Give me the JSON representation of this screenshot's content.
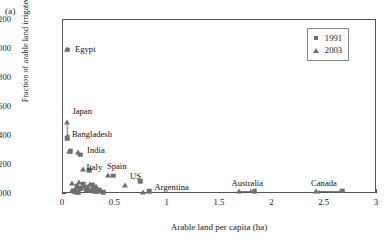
{
  "panel": {
    "label": "(a)"
  },
  "axes": {
    "xlabel": "Arable land per capita (ha)",
    "ylabel": "Fraction of arable land irrigated",
    "xticks": [
      "0",
      "0.5",
      "1",
      "1.5",
      "2",
      "2.5",
      "3"
    ],
    "yticks": [
      "0,000",
      "0,200",
      "0,400",
      "0,600",
      "0,800",
      "1,000",
      "1,200"
    ]
  },
  "legend": {
    "entries": [
      {
        "label": "1991",
        "marker": "square-marker",
        "color": "#6e6e6e"
      },
      {
        "label": "2003",
        "marker": "triangle-marker",
        "color": "#6e6e6e"
      }
    ]
  },
  "annotations": [
    {
      "text": "Egypt",
      "x": 0.115,
      "y": 0.995
    },
    {
      "text": "Japan",
      "x": 0.09,
      "y": 0.565
    },
    {
      "text": "Bangladesh",
      "x": 0.085,
      "y": 0.405
    },
    {
      "text": "India",
      "x": 0.23,
      "y": 0.3
    },
    {
      "text": "Italy",
      "x": 0.225,
      "y": 0.178
    },
    {
      "text": "Spain",
      "x": 0.42,
      "y": 0.185
    },
    {
      "text": "US",
      "x": 0.64,
      "y": 0.118
    },
    {
      "text": "Argentina",
      "x": 0.875,
      "y": 0.04
    },
    {
      "text": "Australia",
      "x": 1.61,
      "y": 0.072
    },
    {
      "text": "Canada",
      "x": 2.37,
      "y": 0.072
    }
  ],
  "chart_data": {
    "type": "scatter",
    "title": "",
    "xlabel": "Arable land per capita (ha)",
    "ylabel": "Fraction of arable land irrigated",
    "xlim": [
      0,
      3
    ],
    "ylim": [
      0,
      1.2
    ],
    "xticks": [
      0,
      0.5,
      1,
      1.5,
      2,
      2.5,
      3
    ],
    "yticks": [
      0,
      0.2,
      0.4,
      0.6,
      0.8,
      1.0,
      1.2
    ],
    "grid": false,
    "legend_position": "top-right",
    "series": [
      {
        "name": "1991",
        "marker": "square",
        "color": "#6e6e6e",
        "points": [
          {
            "x": 0.045,
            "y": 0.995,
            "label": "Egypt"
          },
          {
            "x": 0.04,
            "y": 0.385,
            "label": "Japan"
          },
          {
            "x": 0.075,
            "y": 0.295,
            "label": "Bangladesh"
          },
          {
            "x": 0.165,
            "y": 0.27,
            "label": "India"
          },
          {
            "x": 0.25,
            "y": 0.165,
            "label": "Italy"
          },
          {
            "x": 0.48,
            "y": 0.125,
            "label": "Spain"
          },
          {
            "x": 0.735,
            "y": 0.09,
            "label": "US"
          },
          {
            "x": 0.825,
            "y": 0.018,
            "label": "Argentina"
          },
          {
            "x": 1.83,
            "y": 0.02,
            "label": "Australia"
          },
          {
            "x": 2.67,
            "y": 0.022,
            "label": "Canada"
          },
          {
            "x": 0.13,
            "y": 0.055
          },
          {
            "x": 0.165,
            "y": 0.04
          },
          {
            "x": 0.195,
            "y": 0.07
          },
          {
            "x": 0.215,
            "y": 0.03
          },
          {
            "x": 0.235,
            "y": 0.048
          },
          {
            "x": 0.26,
            "y": 0.022
          },
          {
            "x": 0.285,
            "y": 0.06
          },
          {
            "x": 0.3,
            "y": 0.035
          },
          {
            "x": 0.32,
            "y": 0.015
          },
          {
            "x": 0.345,
            "y": 0.028
          },
          {
            "x": 0.385,
            "y": 0.012
          },
          {
            "x": 0.105,
            "y": 0.018
          },
          {
            "x": 0.145,
            "y": 0.012
          }
        ]
      },
      {
        "name": "2003",
        "marker": "triangle",
        "color": "#6e6e6e",
        "points": [
          {
            "x": 0.035,
            "y": 1.0,
            "label": "Egypt"
          },
          {
            "x": 0.035,
            "y": 0.5,
            "label": "Japan"
          },
          {
            "x": 0.06,
            "y": 0.3,
            "label": "Bangladesh"
          },
          {
            "x": 0.145,
            "y": 0.29,
            "label": "India"
          },
          {
            "x": 0.195,
            "y": 0.175,
            "label": "Italy"
          },
          {
            "x": 0.43,
            "y": 0.13,
            "label": "Spain"
          },
          {
            "x": 0.595,
            "y": 0.065,
            "label": "US"
          },
          {
            "x": 0.76,
            "y": 0.015,
            "label": "Argentina"
          },
          {
            "x": 1.68,
            "y": 0.02,
            "label": "Australia"
          },
          {
            "x": 2.42,
            "y": 0.022,
            "label": "Canada"
          },
          {
            "x": 0.085,
            "y": 0.075
          },
          {
            "x": 0.12,
            "y": 0.05
          },
          {
            "x": 0.15,
            "y": 0.085
          },
          {
            "x": 0.175,
            "y": 0.038
          },
          {
            "x": 0.205,
            "y": 0.058
          },
          {
            "x": 0.23,
            "y": 0.028
          },
          {
            "x": 0.255,
            "y": 0.07
          },
          {
            "x": 0.275,
            "y": 0.042
          },
          {
            "x": 0.295,
            "y": 0.02
          },
          {
            "x": 0.315,
            "y": 0.055
          },
          {
            "x": 0.34,
            "y": 0.018
          },
          {
            "x": 0.09,
            "y": 0.025
          },
          {
            "x": 0.125,
            "y": 0.014
          }
        ]
      }
    ],
    "connectors": [
      {
        "from": [
          0.035,
          0.5
        ],
        "to": [
          0.04,
          0.395
        ],
        "label": "Japan"
      },
      {
        "from": [
          1.68,
          0.02
        ],
        "to": [
          1.82,
          0.02
        ],
        "label": "Australia"
      },
      {
        "from": [
          2.66,
          0.022
        ],
        "to": [
          2.435,
          0.022
        ],
        "label": "Canada"
      }
    ]
  }
}
